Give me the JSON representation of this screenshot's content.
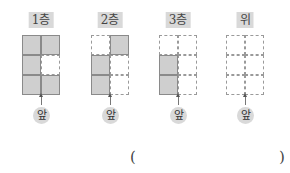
{
  "panels": [
    {
      "label": "1층",
      "cells": [
        "filled",
        "filled",
        "filled",
        "empty",
        "filled",
        "filled"
      ],
      "front_label": "앞"
    },
    {
      "label": "2층",
      "cells": [
        "empty",
        "filled",
        "filled",
        "empty",
        "filled",
        "empty"
      ],
      "front_label": "앞"
    },
    {
      "label": "3층",
      "cells": [
        "empty",
        "empty",
        "filled",
        "empty",
        "filled",
        "empty"
      ],
      "front_label": "앞"
    },
    {
      "label": "위",
      "cells": [
        "empty",
        "empty",
        "empty",
        "empty",
        "empty",
        "empty"
      ],
      "front_label": "앞"
    }
  ],
  "answer": {
    "open": "(",
    "close": ")",
    "value": ""
  }
}
